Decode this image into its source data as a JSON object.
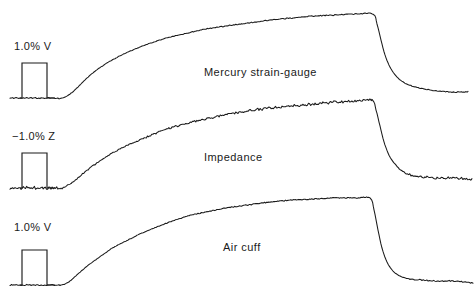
{
  "figure": {
    "background_color": "#ffffff",
    "trace_color": "#1a1a1a",
    "width": 475,
    "height": 300
  },
  "chart_data": {
    "type": "line",
    "title": "",
    "subtitle": "",
    "xlabel": "",
    "ylabel": "",
    "grid": false,
    "legend_position": "inline-annotation",
    "axis_visible": false,
    "xlim": [
      0,
      475
    ],
    "ylim": [
      300,
      0
    ],
    "annotations": [
      {
        "text": "Mercury strain-gauge",
        "x": 204,
        "y": 66
      },
      {
        "text": "Impedance",
        "x": 204,
        "y": 151
      },
      {
        "text": "Air cuff",
        "x": 223,
        "y": 241
      }
    ],
    "series": [
      {
        "name": "Mercury strain-gauge",
        "label": "Mercury strain-gauge",
        "calibration_label": "1.0% V",
        "calibration_amplitude": 1.0,
        "calibration_units": "% V",
        "noise_amplitude": 0.5,
        "baseline_y": 98,
        "peak_y": 14,
        "peak_x": 373,
        "tail_y": 92,
        "tail_end_x": 468,
        "rise_start_x": 62,
        "points": [
          [
            10,
            98
          ],
          [
            20,
            98
          ],
          [
            30,
            98
          ],
          [
            40,
            98
          ],
          [
            50,
            98
          ],
          [
            62,
            98
          ],
          [
            70,
            94
          ],
          [
            78,
            87
          ],
          [
            86,
            79
          ],
          [
            94,
            72
          ],
          [
            104,
            65
          ],
          [
            114,
            59
          ],
          [
            126,
            53
          ],
          [
            140,
            47
          ],
          [
            154,
            42
          ],
          [
            170,
            37
          ],
          [
            188,
            33
          ],
          [
            206,
            29
          ],
          [
            226,
            26
          ],
          [
            248,
            23
          ],
          [
            270,
            20
          ],
          [
            292,
            18
          ],
          [
            314,
            16
          ],
          [
            336,
            15
          ],
          [
            356,
            14
          ],
          [
            373,
            14
          ],
          [
            377,
            24
          ],
          [
            381,
            40
          ],
          [
            385,
            55
          ],
          [
            390,
            67
          ],
          [
            396,
            76
          ],
          [
            403,
            82
          ],
          [
            412,
            86
          ],
          [
            424,
            89
          ],
          [
            438,
            91
          ],
          [
            452,
            92
          ],
          [
            468,
            92
          ]
        ]
      },
      {
        "name": "Impedance",
        "label": "Impedance",
        "calibration_label": "−1.0% Z",
        "calibration_amplitude": -1.0,
        "calibration_units": "% Z",
        "noise_amplitude": 1.3,
        "baseline_y": 188,
        "peak_y": 100,
        "peak_x": 372,
        "tail_y": 178,
        "tail_end_x": 472,
        "rise_start_x": 62,
        "points": [
          [
            10,
            188
          ],
          [
            20,
            188
          ],
          [
            30,
            188
          ],
          [
            40,
            188
          ],
          [
            50,
            188
          ],
          [
            62,
            188
          ],
          [
            70,
            184
          ],
          [
            78,
            178
          ],
          [
            86,
            171
          ],
          [
            94,
            165
          ],
          [
            104,
            158
          ],
          [
            114,
            152
          ],
          [
            126,
            146
          ],
          [
            140,
            140
          ],
          [
            154,
            134
          ],
          [
            170,
            128
          ],
          [
            188,
            123
          ],
          [
            206,
            119
          ],
          [
            226,
            115
          ],
          [
            248,
            111
          ],
          [
            270,
            108
          ],
          [
            292,
            106
          ],
          [
            314,
            104
          ],
          [
            336,
            102
          ],
          [
            356,
            101
          ],
          [
            372,
            100
          ],
          [
            376,
            110
          ],
          [
            380,
            126
          ],
          [
            384,
            142
          ],
          [
            389,
            155
          ],
          [
            395,
            164
          ],
          [
            402,
            171
          ],
          [
            411,
            175
          ],
          [
            422,
            177
          ],
          [
            436,
            178
          ],
          [
            454,
            178
          ],
          [
            472,
            179
          ]
        ]
      },
      {
        "name": "Air cuff",
        "label": "Air cuff",
        "calibration_label": "1.0% V",
        "calibration_amplitude": 1.0,
        "calibration_units": "% V",
        "noise_amplitude": 0.5,
        "baseline_y": 285,
        "peak_y": 198,
        "peak_x": 370,
        "tail_y": 281,
        "tail_end_x": 473,
        "rise_start_x": 62,
        "points": [
          [
            10,
            285
          ],
          [
            20,
            285
          ],
          [
            30,
            285
          ],
          [
            40,
            285
          ],
          [
            50,
            285
          ],
          [
            62,
            285
          ],
          [
            70,
            281
          ],
          [
            78,
            274
          ],
          [
            86,
            267
          ],
          [
            94,
            261
          ],
          [
            104,
            254
          ],
          [
            114,
            247
          ],
          [
            126,
            241
          ],
          [
            140,
            234
          ],
          [
            154,
            228
          ],
          [
            170,
            222
          ],
          [
            188,
            216
          ],
          [
            206,
            212
          ],
          [
            226,
            208
          ],
          [
            248,
            205
          ],
          [
            270,
            202
          ],
          [
            292,
            200
          ],
          [
            314,
            199
          ],
          [
            336,
            198
          ],
          [
            355,
            198
          ],
          [
            370,
            198
          ],
          [
            374,
            210
          ],
          [
            378,
            230
          ],
          [
            382,
            248
          ],
          [
            387,
            262
          ],
          [
            393,
            271
          ],
          [
            400,
            276
          ],
          [
            409,
            279
          ],
          [
            421,
            280
          ],
          [
            436,
            281
          ],
          [
            454,
            281
          ],
          [
            473,
            283
          ]
        ]
      }
    ],
    "calibration_pulses": [
      {
        "series": "Mercury strain-gauge",
        "label": "1.0% V",
        "baseline_y": 98,
        "top_y": 63,
        "start_x": 20,
        "rise_x": 22,
        "fall_x": 47,
        "end_x": 55
      },
      {
        "series": "Impedance",
        "label": "−1.0% Z",
        "baseline_y": 188,
        "top_y": 153,
        "start_x": 20,
        "rise_x": 22,
        "fall_x": 47,
        "end_x": 55
      },
      {
        "series": "Air cuff",
        "label": "1.0% V",
        "baseline_y": 285,
        "top_y": 250,
        "start_x": 20,
        "rise_x": 22,
        "fall_x": 47,
        "end_x": 55
      }
    ]
  }
}
